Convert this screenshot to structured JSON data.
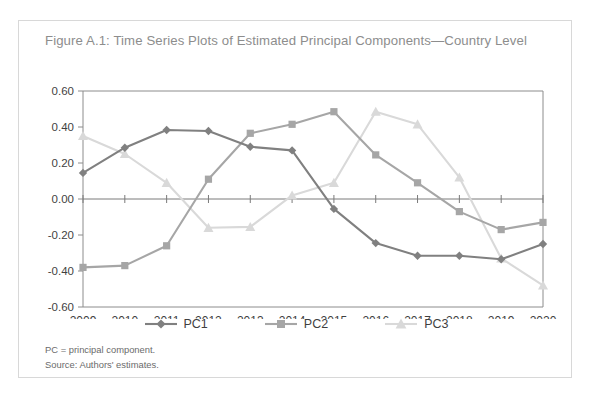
{
  "figure": {
    "title": "Figure A.1: Time Series Plots of Estimated Principal Components—Country Level",
    "notes": [
      "PC = principal component.",
      "Source: Authors' estimates."
    ]
  },
  "legend": {
    "position": "bottom-center",
    "entries": [
      {
        "label": "PC1",
        "marker": "diamond",
        "color": "#808080"
      },
      {
        "label": "PC2",
        "marker": "square",
        "color": "#a6a6a6"
      },
      {
        "label": "PC3",
        "marker": "triangle",
        "color": "#d9d9d9"
      }
    ]
  },
  "chart_data": {
    "type": "line",
    "title": "Figure A.1: Time Series Plots of Estimated Principal Components—Country Level",
    "xlabel": "",
    "ylabel": "",
    "x": [
      2009,
      2010,
      2011,
      2012,
      2013,
      2014,
      2015,
      2016,
      2017,
      2018,
      2019,
      2020
    ],
    "xtick_labels": [
      "2009",
      "2010",
      "2011",
      "2012",
      "2013",
      "2014",
      "2015",
      "2016",
      "2017",
      "2018",
      "2019",
      "2020"
    ],
    "ytick_labels": [
      "0.60",
      "0.40",
      "0.20",
      "0.00",
      "-0.20",
      "-0.40",
      "-0.60"
    ],
    "yticks": [
      0.6,
      0.4,
      0.2,
      0.0,
      -0.2,
      -0.4,
      -0.6
    ],
    "ylim": [
      -0.6,
      0.6
    ],
    "grid": false,
    "zero_line": true,
    "series": [
      {
        "name": "PC1",
        "marker": "diamond",
        "color": "#808080",
        "values": [
          0.145,
          0.285,
          0.383,
          0.378,
          0.29,
          0.27,
          -0.055,
          -0.245,
          -0.315,
          -0.315,
          -0.335,
          -0.25
        ]
      },
      {
        "name": "PC2",
        "marker": "square",
        "color": "#a6a6a6",
        "values": [
          -0.38,
          -0.37,
          -0.26,
          0.11,
          0.365,
          0.415,
          0.485,
          0.245,
          0.09,
          -0.07,
          -0.17,
          -0.13
        ]
      },
      {
        "name": "PC3",
        "marker": "triangle",
        "color": "#d9d9d9",
        "values": [
          0.35,
          0.25,
          0.09,
          -0.16,
          -0.155,
          0.02,
          0.09,
          0.485,
          0.415,
          0.12,
          -0.33,
          -0.48
        ]
      }
    ]
  }
}
